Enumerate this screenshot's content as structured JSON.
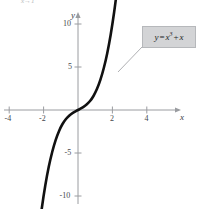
{
  "figure": {
    "clipped_note": "x→1",
    "background_color": "#ffffff"
  },
  "axes": {
    "x_name": "x",
    "y_name": "y",
    "axis_color": "#9a9ca0",
    "origin_px": [
      78,
      110
    ],
    "x_px_per_unit": 17.2,
    "y_px_per_unit": 8.6
  },
  "annotation": {
    "box_fill": "#d3d4d6",
    "box_border": "#b6b8bb",
    "leader_color": "#9a9ca0",
    "label_lhs": "y",
    "label_eq": "=",
    "label_base": "x",
    "label_exponent": "3",
    "label_plus": "+",
    "label_tail": "x"
  },
  "chart_data": {
    "type": "line",
    "title": "",
    "subtitle": "",
    "xlabel": "x",
    "ylabel": "y",
    "xlim": [
      -4.6,
      4.8
    ],
    "ylim": [
      -12.5,
      12.5
    ],
    "grid": false,
    "legend_position": "none",
    "curve_color": "#111111",
    "curve_width_px": 2.6,
    "arrowheads": [
      "start",
      "end"
    ],
    "annotations": [
      {
        "text": "y = x^3 + x",
        "kind": "callout-box",
        "anchor_point": [
          2.35,
          13.9
        ],
        "box_px": [
          142,
          26,
          54,
          22
        ]
      }
    ],
    "x_ticks": [
      -4,
      -2,
      2,
      4
    ],
    "x_tick_labels": [
      "-4",
      "-2",
      "2",
      "4"
    ],
    "y_ticks": [
      10,
      5,
      -5,
      -10
    ],
    "y_tick_labels": [
      "10",
      "5",
      "-5",
      "-10"
    ],
    "equation": "y = x^3 + x",
    "x": [
      -2.28,
      -2.1,
      -1.9,
      -1.7,
      -1.5,
      -1.3,
      -1.1,
      -0.9,
      -0.7,
      -0.5,
      -0.3,
      -0.1,
      0.1,
      0.3,
      0.5,
      0.7,
      0.9,
      1.1,
      1.3,
      1.5,
      1.7,
      1.9,
      2.1,
      2.28
    ],
    "values": [
      -14.12,
      -11.36,
      -8.76,
      -6.61,
      -4.88,
      -3.5,
      -2.43,
      -1.63,
      -1.04,
      -0.63,
      -0.33,
      -0.1,
      0.1,
      0.33,
      0.63,
      1.04,
      1.63,
      2.43,
      3.5,
      4.88,
      6.61,
      8.76,
      11.36,
      14.12
    ],
    "series": [
      {
        "name": "y = x^3 + x",
        "x": [
          -2.28,
          -2.1,
          -1.9,
          -1.7,
          -1.5,
          -1.3,
          -1.1,
          -0.9,
          -0.7,
          -0.5,
          -0.3,
          -0.1,
          0.1,
          0.3,
          0.5,
          0.7,
          0.9,
          1.1,
          1.3,
          1.5,
          1.7,
          1.9,
          2.1,
          2.28
        ],
        "values": [
          -14.12,
          -11.36,
          -8.76,
          -6.61,
          -4.88,
          -3.5,
          -2.43,
          -1.63,
          -1.04,
          -0.63,
          -0.33,
          -0.1,
          0.1,
          0.33,
          0.63,
          1.04,
          1.63,
          2.43,
          3.5,
          4.88,
          6.61,
          8.76,
          11.36,
          14.12
        ]
      }
    ]
  }
}
